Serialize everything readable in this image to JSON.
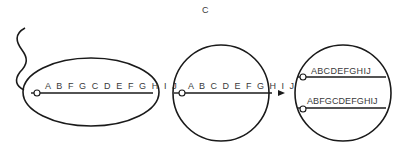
{
  "panel_label": "C",
  "stages": [
    {
      "name": "integration-state",
      "shape": "ellipse",
      "sequence": "ABFGCDEFGHIJ",
      "sequence_display": "A B F G C D E F G H I J"
    },
    {
      "name": "circular-intermediate",
      "shape": "circle",
      "sequence": "ABCDEFGHIJ",
      "sequence_display": "A B C D E F G H I J"
    },
    {
      "name": "resolved-products",
      "shape": "circle",
      "sequences": [
        {
          "sequence": "ABCDEFGHIJ"
        },
        {
          "sequence": "ABFGCDEFGHIJ"
        }
      ]
    }
  ],
  "colors": {
    "stroke": "#1a1a1a",
    "text": "#3a3a3a",
    "background": "#ffffff"
  }
}
